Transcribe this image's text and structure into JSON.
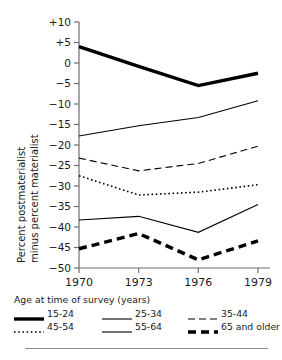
{
  "chart_data": {
    "type": "line",
    "title": "",
    "xlabel": "",
    "ylabel": "Percent postmaterialist minus percent materialist",
    "ylabel_line1": "Percent postmaterialist",
    "ylabel_line2": "minus percent materialist",
    "legend_title": "Age at time of survey (years)",
    "legend_position": "bottom",
    "grid": false,
    "x": [
      1970,
      1973,
      1976,
      1979
    ],
    "xticklabels": [
      "1970",
      "1973",
      "1976",
      "1979"
    ],
    "ylim": [
      -50,
      10
    ],
    "yticks": [
      10,
      5,
      0,
      -5,
      -10,
      -15,
      -20,
      -25,
      -30,
      -35,
      -40,
      -45,
      -50
    ],
    "yticklabels": [
      "+10",
      "+5",
      "0",
      "-5",
      "-10",
      "-15",
      "-20",
      "-25",
      "-30",
      "-35",
      "-40",
      "-45",
      "-50"
    ],
    "series": [
      {
        "name": "15-24",
        "style": "thick-solid",
        "values": [
          4.0,
          -0.8,
          -5.5,
          -2.5
        ]
      },
      {
        "name": "25-34",
        "style": "thin-solid",
        "values": [
          -17.8,
          -15.3,
          -13.3,
          -9.2
        ]
      },
      {
        "name": "35-44",
        "style": "thin-dashed",
        "values": [
          -23.2,
          -26.3,
          -24.5,
          -20.3
        ]
      },
      {
        "name": "45-54",
        "style": "dotted",
        "values": [
          -27.5,
          -32.2,
          -31.5,
          -29.7
        ]
      },
      {
        "name": "55-64",
        "style": "thin-solid",
        "values": [
          -38.3,
          -37.4,
          -41.3,
          -34.5
        ]
      },
      {
        "name": "65 and older",
        "style": "thick-dashed",
        "values": [
          -45.3,
          -41.6,
          -48.0,
          -43.4
        ]
      }
    ]
  },
  "legend": {
    "title": "Age at time of survey (years)",
    "items": [
      {
        "label": "15-24",
        "style": "thick-solid"
      },
      {
        "label": "25-34",
        "style": "thin-solid"
      },
      {
        "label": "35-44",
        "style": "thin-dashed"
      },
      {
        "label": "45-54",
        "style": "dotted"
      },
      {
        "label": "55-64",
        "style": "thin-solid"
      },
      {
        "label": "65 and older",
        "style": "thick-dashed"
      }
    ]
  },
  "colors": {
    "line": "#000000",
    "axis": "#6e6e6e",
    "text": "#1a1a1a",
    "rule": "#8b8b8b",
    "background": "#ffffff"
  }
}
